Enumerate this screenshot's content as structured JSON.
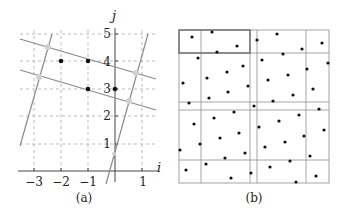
{
  "figure": {
    "panel_a": {
      "caption": "(a)",
      "x_axis_label": "i",
      "y_axis_label": "j",
      "x_ticks": [
        {
          "value": -3,
          "label": "−3"
        },
        {
          "value": -2,
          "label": "−2"
        },
        {
          "value": -1,
          "label": "−1"
        },
        {
          "value": 1,
          "label": "1"
        }
      ],
      "y_ticks": [
        {
          "value": 1,
          "label": "1"
        },
        {
          "value": 2,
          "label": "2"
        },
        {
          "value": 3,
          "label": "3"
        },
        {
          "value": 4,
          "label": "4"
        },
        {
          "value": 5,
          "label": "5"
        }
      ],
      "grid": "dashed",
      "black_points": [
        [
          -2,
          4
        ],
        [
          -1,
          4
        ],
        [
          -1,
          3
        ],
        [
          0,
          3
        ]
      ],
      "colors": {
        "lines": "#8a8a8a",
        "points": "#111111",
        "grid": "#aaaaaa",
        "intersections": "#cfcfcf"
      }
    },
    "panel_b": {
      "caption": "(b)",
      "description": "Square region subdivided by vertical and horizontal lines into cells with scattered sample points; top-left cell highlighted"
    }
  }
}
